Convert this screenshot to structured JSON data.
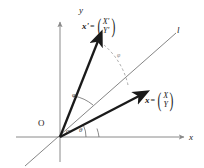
{
  "figure": {
    "type": "vector-rotation-diagram",
    "background": "#ffffff",
    "stroke_dark": "#1a1a1a",
    "stroke_thin": "#555555",
    "stroke_axis": "#8a8a8a",
    "stroke_dashed": "#9a9a9a"
  },
  "axes": {
    "x_label": "x",
    "y_label": "y",
    "origin_label": "O"
  },
  "line": {
    "label": "l"
  },
  "vectors": [
    {
      "name": "x'",
      "equals": "=",
      "components": {
        "top": "X'",
        "bottom": "Y'"
      },
      "tip": {
        "x": 98,
        "y": 40
      }
    },
    {
      "name": "x",
      "equals": "=",
      "components": {
        "top": "X",
        "bottom": "Y"
      },
      "tip": {
        "x": 140,
        "y": 95
      }
    }
  ],
  "angles": [
    {
      "label": "α",
      "name": "alpha"
    },
    {
      "label": "θ",
      "name": "theta"
    },
    {
      "label": "φ",
      "name": "phi-inner"
    },
    {
      "label": "φ",
      "name": "phi-outer"
    }
  ]
}
